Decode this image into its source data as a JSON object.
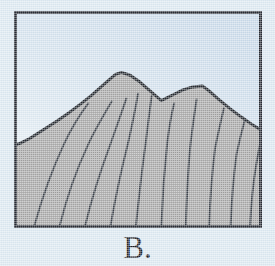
{
  "figure": {
    "caption": "B.",
    "frame": {
      "border_color": "#262b33",
      "border_width_px": 3,
      "x": 14,
      "y": 11,
      "width": 248,
      "height": 217
    },
    "colors": {
      "page_background": "#dce9f2",
      "sky": "#cfdeeb",
      "sky_highlight": "#eef4f9",
      "rock_fill": "#a8a8a8",
      "rock_outline": "#23282f",
      "stratum_line": "#3a4049",
      "caption_text": "#1c2026"
    },
    "illustration": {
      "subject": "mountain-ridge-cross-section",
      "description": "Shaded mountain silhouette with two summits and curved stratum lines",
      "sky_label": "sky-background",
      "ridge_label": "mountain-ridge",
      "peaks": [
        {
          "name": "left-summit",
          "x": 115,
          "y": 71
        },
        {
          "name": "right-summit",
          "x": 198,
          "y": 84
        }
      ],
      "saddle": {
        "name": "saddle-notch",
        "x": 156,
        "y": 99
      },
      "ridge_outline_points": "17,142 27,136 41,128 55,119 68,110 80,101 90,93 99,85 108,77 115,71 124,73 134,80 142,87 150,94 156,99 162,96 170,92 178,88 188,85 198,84 206,90 215,98 226,107 238,116 248,123 259,128",
      "stratum_count": 10,
      "strata": [
        {
          "name": "stratum-line-1",
          "d": "M 29,214 C 38,186 48,160 60,136 C 68,121 76,110 84,101"
        },
        {
          "name": "stratum-line-2",
          "d": "M 55,214 C 63,186 73,160 85,136 C 93,121 101,110 108,99"
        },
        {
          "name": "stratum-line-3",
          "d": "M 81,214 C 89,186 98,160 108,135 C 114,120 119,108 123,96"
        },
        {
          "name": "stratum-line-4",
          "d": "M 107,214 C 113,186 119,160 126,134 C 130,118 133,104 135,91"
        },
        {
          "name": "stratum-line-5",
          "d": "M 133,214 C 137,186 140,160 144,134 C 146,118 148,104 149,93"
        },
        {
          "name": "stratum-line-6",
          "d": "M 159,214 C 161,186 163,160 166,134 C 168,120 170,110 172,101"
        },
        {
          "name": "stratum-line-7",
          "d": "M 184,214 C 185,186 186,160 189,134 C 191,119 193,108 195,97"
        },
        {
          "name": "stratum-line-8",
          "d": "M 208,214 C 209,186 211,162 214,140 C 217,126 220,115 223,106"
        },
        {
          "name": "stratum-line-9",
          "d": "M 230,214 C 231,188 233,166 236,146 C 239,133 242,123 245,115"
        },
        {
          "name": "stratum-line-10",
          "d": "M 250,214 C 251,192 253,174 256,158 C 258,146 260,137 262,130"
        }
      ]
    }
  }
}
